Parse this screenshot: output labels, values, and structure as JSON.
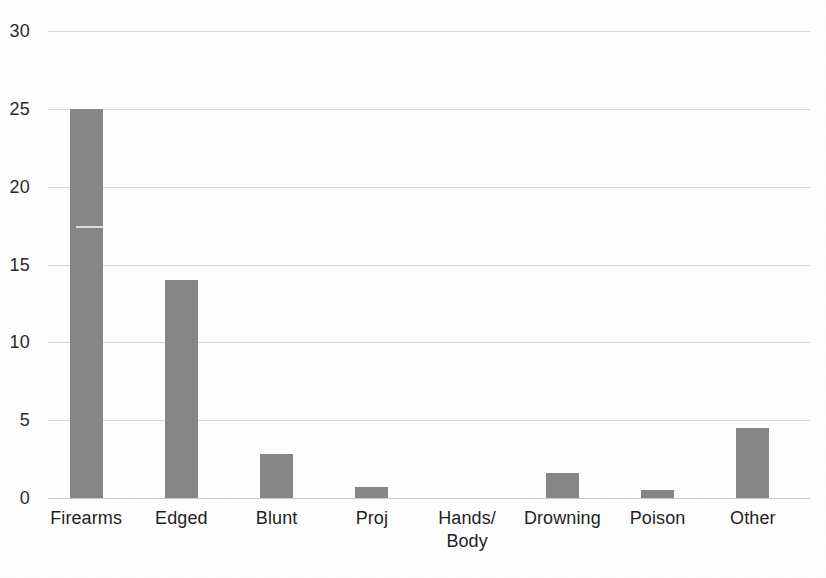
{
  "chart_data": {
    "type": "bar",
    "title": "",
    "subtitle": "",
    "xlabel": "",
    "ylabel": "",
    "ylim": [
      0,
      30
    ],
    "y_ticks": [
      0,
      5,
      10,
      15,
      20,
      25,
      30
    ],
    "y_tick_labels": [
      "0",
      "5",
      "10",
      "15",
      "20",
      "25",
      "30"
    ],
    "grid": true,
    "legend": false,
    "legend_position": "none",
    "bar_color": "#878787",
    "gridline_color": "#d9d9d9",
    "background_color": "#fefefe",
    "categories": [
      "Firearms",
      "Edged",
      "Blunt",
      "Proj",
      "Hands/ Body",
      "Drowning",
      "Poison",
      "Other"
    ],
    "category_label_lines": [
      [
        "Firearms"
      ],
      [
        "Edged"
      ],
      [
        "Blunt"
      ],
      [
        "Proj"
      ],
      [
        "Hands/",
        "Body"
      ],
      [
        "Drowning"
      ],
      [
        "Poison"
      ],
      [
        "Other"
      ]
    ],
    "values": [
      25,
      14,
      2.8,
      0.7,
      0,
      1.6,
      0.5,
      4.5
    ],
    "annotations": []
  },
  "axes": {
    "y": {
      "ticks": [
        {
          "label": "30",
          "value": 30
        },
        {
          "label": "25",
          "value": 25
        },
        {
          "label": "20",
          "value": 20
        },
        {
          "label": "15",
          "value": 15
        },
        {
          "label": "10",
          "value": 10
        },
        {
          "label": "5",
          "value": 5
        },
        {
          "label": "0",
          "value": 0
        }
      ]
    },
    "x": {
      "ticks": [
        {
          "line1": "Firearms",
          "line2": ""
        },
        {
          "line1": "Edged",
          "line2": ""
        },
        {
          "line1": "Blunt",
          "line2": ""
        },
        {
          "line1": "Proj",
          "line2": ""
        },
        {
          "line1": "Hands/",
          "line2": "Body"
        },
        {
          "line1": "Drowning",
          "line2": ""
        },
        {
          "line1": "Poison",
          "line2": ""
        },
        {
          "line1": "Other",
          "line2": ""
        }
      ]
    }
  },
  "bars": [
    {
      "category": "Firearms",
      "value": 25
    },
    {
      "category": "Edged",
      "value": 14
    },
    {
      "category": "Blunt",
      "value": 2.8
    },
    {
      "category": "Proj",
      "value": 0.7
    },
    {
      "category": "Hands/ Body",
      "value": 0
    },
    {
      "category": "Drowning",
      "value": 1.6
    },
    {
      "category": "Poison",
      "value": 0.5
    },
    {
      "category": "Other",
      "value": 4.5
    }
  ]
}
